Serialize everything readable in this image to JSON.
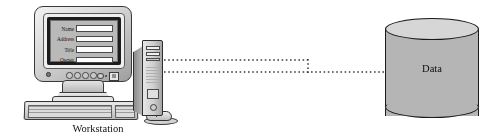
{
  "diagram": {
    "width": 501,
    "height": 140,
    "background_color": "#ffffff"
  },
  "workstation": {
    "caption": "Workstation",
    "monitor": {
      "form_fields": [
        {
          "label": "Name",
          "value": ""
        },
        {
          "label": "Address",
          "value": ""
        },
        {
          "label": "Title",
          "value": ""
        },
        {
          "label": "Owner",
          "value": ""
        }
      ],
      "screen_color": "#b9b9b9",
      "case_color": "#d3d3d3"
    },
    "tower": {
      "case_color": "#cfcfcf"
    },
    "keyboard": {
      "case_color": "#bdbdbd"
    },
    "mouse": {
      "case_color": "#bcbcbc"
    }
  },
  "database": {
    "label": "Data",
    "body_color": "#b5b5b5",
    "top_color": "#d6d6d6",
    "outline_color": "#1a1a1a"
  },
  "connections": {
    "line_style": "dotted",
    "line_color": "#3d3d3d",
    "segments": [
      {
        "name": "upper-horizontal",
        "x1": 164,
        "y1": 60,
        "x2": 308,
        "y2": 60
      },
      {
        "name": "vertical-link",
        "x1": 308,
        "y1": 60,
        "x2": 308,
        "y2": 72
      },
      {
        "name": "lower-horizontal",
        "x1": 164,
        "y1": 72,
        "x2": 385,
        "y2": 72
      }
    ]
  }
}
